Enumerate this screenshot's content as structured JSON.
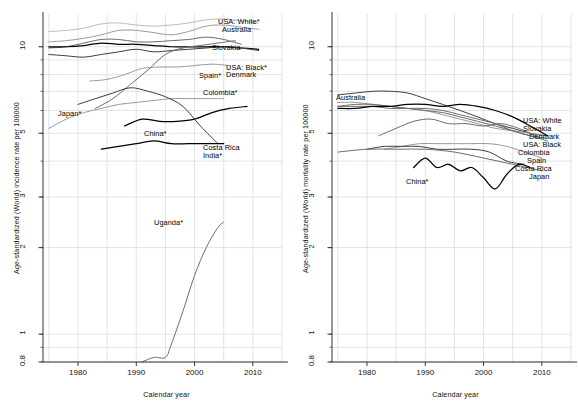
{
  "figure": {
    "panels": [
      {
        "id": "incidence",
        "ylabel": "Age-standardized (World) incidence rate per 100000",
        "xlabel": "Calendar year"
      },
      {
        "id": "mortality",
        "ylabel": "Age-standardized (World) mortality rate per 100000",
        "xlabel": "Calendar year"
      }
    ]
  },
  "axes": {
    "x_ticks": [
      "1980",
      "1990",
      "2000",
      "2010"
    ],
    "y_ticks": [
      "0.8",
      "1",
      "2",
      "3",
      "5",
      "10"
    ]
  },
  "colors": {
    "grid": "#c9d2de",
    "axis": "#333333",
    "text": "#111111",
    "line_black": "#000000",
    "line_dark": "#3d3d3d",
    "line_mid": "#6b6b6b",
    "line_light": "#9a9a9a",
    "line_pale": "#bcbcbc",
    "background": "#ffffff"
  },
  "chart_data": [
    {
      "type": "line",
      "panel": "left",
      "title": "",
      "xlabel": "Calendar year",
      "ylabel": "Age-standardized (World) incidence rate per 100000",
      "xlim": [
        1974,
        2015
      ],
      "ylim": [
        0.8,
        13
      ],
      "yscale": "log",
      "xticks": [
        1980,
        1990,
        2000,
        2010
      ],
      "yticks": [
        0.8,
        1,
        2,
        3,
        5,
        10
      ],
      "grid": true,
      "legend": "inline-labels-right",
      "series": [
        {
          "name": "USA: White*",
          "color": "#bcbcbc",
          "label_x": 218,
          "label_y": 18,
          "x": [
            1975,
            1978,
            1981,
            1984,
            1987,
            1990,
            1993,
            1996,
            1999,
            2002,
            2005,
            2008,
            2011
          ],
          "y": [
            11.3,
            11.4,
            11.6,
            12.0,
            12.1,
            11.9,
            11.8,
            11.9,
            12.1,
            12.4,
            12.5,
            12.3,
            12.1
          ]
        },
        {
          "name": "Australia",
          "color": "#9a9a9a",
          "label_x": 222,
          "label_y": 26,
          "x": [
            1975,
            1978,
            1981,
            1984,
            1987,
            1990,
            1993,
            1996,
            1999,
            2002,
            2005,
            2008,
            2011
          ],
          "y": [
            10.4,
            10.5,
            10.7,
            11.0,
            11.4,
            11.4,
            11.2,
            11.0,
            11.3,
            11.8,
            11.9,
            11.7,
            11.5
          ]
        },
        {
          "name": "Slovakia",
          "color": "#6b6b6b",
          "label_x": 212,
          "label_y": 44,
          "x": [
            1975,
            1978,
            1981,
            1984,
            1987,
            1990,
            1993,
            1996,
            1999,
            2002,
            2005,
            2008
          ],
          "y": [
            9.9,
            10.0,
            10.3,
            10.6,
            10.6,
            10.4,
            10.4,
            10.5,
            10.6,
            10.8,
            10.6,
            10.2
          ]
        },
        {
          "name": "USA: Black*",
          "color": "#000000",
          "label_x": 226,
          "label_y": 64,
          "x": [
            1975,
            1978,
            1981,
            1984,
            1987,
            1990,
            1993,
            1996,
            1999,
            2002,
            2005,
            2008,
            2011
          ],
          "y": [
            10.0,
            10.0,
            10.1,
            10.3,
            10.2,
            10.2,
            10.1,
            10.0,
            10.0,
            10.0,
            10.0,
            9.9,
            9.8
          ]
        },
        {
          "name": "Denmark",
          "color": "#3d3d3d",
          "label_x": 226,
          "label_y": 71,
          "x": [
            1975,
            1978,
            1981,
            1984,
            1987,
            1990,
            1993,
            1996,
            1999,
            2002,
            2005,
            2008,
            2011
          ],
          "y": [
            9.4,
            9.3,
            9.2,
            9.4,
            9.6,
            9.8,
            9.6,
            9.7,
            9.8,
            9.9,
            10.0,
            9.9,
            9.7
          ]
        },
        {
          "name": "Spain*",
          "color": "#6b6b6b",
          "label_x": 199,
          "label_y": 72,
          "x": [
            1983,
            1986,
            1989,
            1992,
            1995,
            1998,
            2001,
            2004,
            2007
          ],
          "y": [
            6.1,
            6.6,
            7.4,
            8.3,
            9.4,
            9.9,
            10.1,
            10.3,
            10.5
          ]
        },
        {
          "name": "Colombia*",
          "color": "#9a9a9a",
          "label_x": 203,
          "label_y": 89,
          "x": [
            1982,
            1985,
            1988,
            1991,
            1994,
            1997,
            2000,
            2003,
            2006
          ],
          "y": [
            7.6,
            7.7,
            8.0,
            8.4,
            8.5,
            8.5,
            8.6,
            8.7,
            8.6
          ]
        },
        {
          "name": "Japan*",
          "color": "#9a9a9a",
          "label_x": 58,
          "label_y": 110,
          "x": [
            1975,
            1978,
            1981,
            1984,
            1987,
            1990,
            1993,
            1996,
            1999,
            2002,
            2005
          ],
          "y": [
            5.2,
            5.6,
            5.9,
            6.1,
            6.3,
            6.4,
            6.5,
            6.6,
            6.6,
            6.6,
            6.6
          ]
        },
        {
          "name": "China*",
          "color": "#000000",
          "label_x": 144,
          "label_y": 130,
          "x": [
            1988,
            1991,
            1994,
            1997,
            2000,
            2003,
            2006,
            2009
          ],
          "y": [
            5.3,
            5.6,
            5.5,
            5.5,
            5.6,
            5.9,
            6.1,
            6.2
          ]
        },
        {
          "name": "Costa Rica",
          "color": "#3d3d3d",
          "label_x": 203,
          "label_y": 144,
          "x": [
            1980,
            1983,
            1986,
            1989,
            1992,
            1995,
            1998,
            2001,
            2004
          ],
          "y": [
            6.3,
            6.6,
            6.9,
            7.2,
            7.0,
            6.7,
            6.2,
            5.3,
            4.6
          ]
        },
        {
          "name": "India*",
          "color": "#000000",
          "label_x": 203,
          "label_y": 152,
          "x": [
            1984,
            1987,
            1990,
            1993,
            1996,
            1999,
            2002,
            2005
          ],
          "y": [
            4.4,
            4.5,
            4.6,
            4.7,
            4.6,
            4.6,
            4.6,
            4.6
          ]
        },
        {
          "name": "Uganda*",
          "color": "#6b6b6b",
          "label_x": 154,
          "label_y": 219,
          "x": [
            1991,
            1993,
            1995,
            1996,
            1998,
            2000,
            2002,
            2004,
            2005
          ],
          "y": [
            0.8,
            0.83,
            0.83,
            0.92,
            1.2,
            1.6,
            2.0,
            2.35,
            2.45
          ]
        }
      ]
    },
    {
      "type": "line",
      "panel": "right",
      "title": "",
      "xlabel": "Calendar year",
      "ylabel": "Age-standardized (World) mortality rate per 100000",
      "xlim": [
        1974,
        2015
      ],
      "ylim": [
        0.8,
        13
      ],
      "yscale": "log",
      "xticks": [
        1980,
        1990,
        2000,
        2010
      ],
      "yticks": [
        0.8,
        1,
        2,
        3,
        5,
        10
      ],
      "grid": true,
      "legend": "inline-labels-right",
      "series": [
        {
          "name": "Australia",
          "color": "#3d3d3d",
          "label_x": 47,
          "label_y": 94,
          "x": [
            1975,
            1978,
            1981,
            1984,
            1987,
            1990,
            1993,
            1996,
            1999,
            2002,
            2005,
            2008,
            2011
          ],
          "y": [
            6.8,
            6.9,
            7.0,
            7.0,
            6.9,
            6.6,
            6.3,
            6.0,
            5.7,
            5.4,
            5.2,
            5.0,
            4.9
          ]
        },
        {
          "name": "USA: White",
          "color": "#9a9a9a",
          "label_x": 234,
          "label_y": 117,
          "x": [
            1975,
            1978,
            1981,
            1984,
            1987,
            1990,
            1993,
            1996,
            1999,
            2002,
            2005,
            2008,
            2011
          ],
          "y": [
            6.4,
            6.4,
            6.3,
            6.2,
            6.1,
            6.0,
            5.8,
            5.6,
            5.4,
            5.2,
            5.1,
            5.0,
            4.9
          ]
        },
        {
          "name": "Slovakia",
          "color": "#6b6b6b",
          "label_x": 234,
          "label_y": 125,
          "x": [
            1975,
            1978,
            1981,
            1984,
            1987,
            1990,
            1993,
            1996,
            1999,
            2002,
            2005,
            2008,
            2011
          ],
          "y": [
            6.2,
            6.3,
            6.3,
            6.2,
            6.1,
            6.0,
            5.9,
            5.7,
            5.5,
            5.3,
            5.1,
            4.9,
            4.8
          ]
        },
        {
          "name": "Denmark",
          "color": "#6b6b6b",
          "label_x": 240,
          "label_y": 133,
          "x": [
            1975,
            1978,
            1981,
            1984,
            1987,
            1990,
            1993,
            1996,
            1999,
            2002,
            2005,
            2008,
            2011
          ],
          "y": [
            6.2,
            6.2,
            6.2,
            6.1,
            6.1,
            6.1,
            6.0,
            5.8,
            5.6,
            5.4,
            5.1,
            4.9,
            4.7
          ]
        },
        {
          "name": "USA: Black",
          "color": "#000000",
          "label_x": 234,
          "label_y": 141,
          "x": [
            1975,
            1978,
            1981,
            1984,
            1987,
            1990,
            1993,
            1996,
            1999,
            2002,
            2005,
            2008,
            2011
          ],
          "y": [
            6.1,
            6.1,
            6.2,
            6.2,
            6.3,
            6.3,
            6.2,
            6.3,
            6.2,
            6.0,
            5.7,
            5.3,
            4.9
          ]
        },
        {
          "name": "Colombia",
          "color": "#6b6b6b",
          "label_x": 229,
          "label_y": 149,
          "x": [
            1982,
            1985,
            1988,
            1991,
            1994,
            1997,
            2000,
            2003,
            2006,
            2009
          ],
          "y": [
            4.9,
            5.2,
            5.5,
            5.6,
            5.4,
            5.4,
            5.3,
            5.4,
            5.2,
            4.9
          ]
        },
        {
          "name": "Spain",
          "color": "#9a9a9a",
          "label_x": 238,
          "label_y": 157,
          "x": [
            1983,
            1986,
            1989,
            1992,
            1995,
            1998,
            2001,
            2004,
            2007,
            2010
          ],
          "y": [
            4.4,
            4.5,
            4.6,
            4.6,
            4.6,
            4.6,
            4.6,
            4.5,
            4.3,
            4.1
          ]
        },
        {
          "name": "Costa Rica",
          "color": "#3d3d3d",
          "label_x": 226,
          "label_y": 165,
          "x": [
            1980,
            1983,
            1986,
            1989,
            1992,
            1995,
            1998,
            2001,
            2004,
            2007
          ],
          "y": [
            4.4,
            4.5,
            4.5,
            4.5,
            4.4,
            4.4,
            4.4,
            4.3,
            4.0,
            3.9
          ]
        },
        {
          "name": "Japan",
          "color": "#6b6b6b",
          "label_x": 240,
          "label_y": 173,
          "x": [
            1975,
            1980,
            1985,
            1990,
            1995,
            2000,
            2005,
            2010
          ],
          "y": [
            4.3,
            4.4,
            4.4,
            4.4,
            4.3,
            4.1,
            3.9,
            3.7
          ]
        },
        {
          "name": "China*",
          "color": "#000000",
          "label_x": 117,
          "label_y": 178,
          "x": [
            1988,
            1990,
            1992,
            1994,
            1996,
            1998,
            2000,
            2002,
            2004,
            2006,
            2008
          ],
          "y": [
            3.8,
            4.1,
            3.8,
            3.9,
            3.7,
            3.8,
            3.5,
            3.2,
            3.6,
            3.9,
            3.8
          ]
        }
      ]
    }
  ]
}
